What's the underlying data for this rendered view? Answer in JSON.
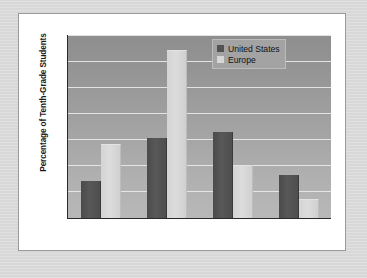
{
  "chart_data": {
    "type": "bar",
    "title": "",
    "xlabel": "",
    "ylabel": "Percentage of Tenth-Grade Students",
    "categories": [
      "Tobacco",
      "Alcohol",
      "Marijuana",
      "Other Illegal\nDrugs"
    ],
    "category_lines": [
      [
        "Tobacco"
      ],
      [
        "Alcohol"
      ],
      [
        "Marijuana"
      ],
      [
        "Other Illegal",
        "Drugs"
      ]
    ],
    "series": [
      {
        "name": "United States",
        "color": "#525252",
        "values": [
          14,
          30.5,
          33,
          16.5
        ]
      },
      {
        "name": "Europe",
        "color": "#d6d6d6",
        "values": [
          28,
          64,
          20,
          7
        ]
      }
    ],
    "ylim": [
      0,
      70
    ],
    "yticks": [
      0,
      10,
      20,
      30,
      40,
      50,
      60,
      70
    ],
    "ytick_labels": [
      "0",
      "10",
      "20",
      "30",
      "40",
      "50",
      "60",
      "70"
    ],
    "grid": true,
    "legend_position": "top-right",
    "plot_background": "#9d9d9d",
    "gridline_color": "#e9e9e9",
    "axis_color": "#2a2a2a",
    "card_background": "#ffffff",
    "page_background": "#dadada"
  }
}
